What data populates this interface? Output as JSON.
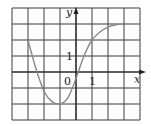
{
  "chart_data": {
    "type": "line",
    "title": "",
    "xlabel": "x",
    "ylabel": "y",
    "x_tick_labels": [
      {
        "value": 1,
        "label": "1"
      }
    ],
    "y_tick_labels": [
      {
        "value": 1,
        "label": "1"
      }
    ],
    "origin_label": "0",
    "xlim": [
      -4,
      4
    ],
    "ylim": [
      -3,
      4
    ],
    "grid": true,
    "grid_spacing": 1,
    "legend": null,
    "series": [
      {
        "name": "curve",
        "color": "#8a8a8a",
        "x": [
          -3,
          -2.5,
          -2,
          -1.5,
          -1,
          -0.5,
          0,
          0.5,
          1,
          1.5,
          2,
          2.5,
          3
        ],
        "y": [
          2,
          0.2,
          -1.2,
          -1.85,
          -2,
          -1.6,
          -0.4,
          1.0,
          2.0,
          2.5,
          2.8,
          2.95,
          3
        ]
      }
    ]
  },
  "labels": {
    "x_axis": "x",
    "y_axis": "y",
    "origin": "0",
    "x_tick_1": "1",
    "y_tick_1": "1"
  },
  "colors": {
    "grid": "#3a3a3a",
    "curve": "#8a8a8a",
    "background": "#ffffff"
  }
}
